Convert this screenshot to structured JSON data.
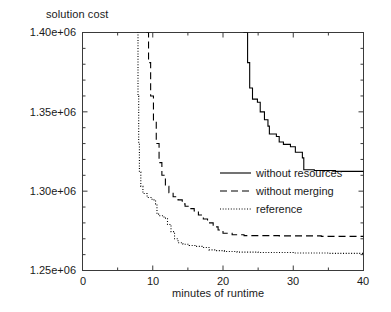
{
  "chart_data": {
    "type": "line",
    "title": "",
    "xlabel": "minutes of runtime",
    "ylabel": "solution cost",
    "xlim": [
      0,
      40
    ],
    "ylim": [
      1250000,
      1400000
    ],
    "xticks": [
      0,
      10,
      20,
      30,
      40
    ],
    "xtick_labels": [
      "0",
      "10",
      "20",
      "30",
      "40"
    ],
    "yticks": [
      1250000,
      1300000,
      1350000,
      1400000
    ],
    "ytick_labels": [
      "1.25e+06",
      "1.30e+06",
      "1.35e+06",
      "1.40e+06"
    ],
    "minor_ticks": true,
    "grid": false,
    "legend_position": "center-right",
    "series": [
      {
        "name": "without resources",
        "style": "solid",
        "color": "#000000",
        "points": [
          [
            22.9,
            1400000
          ],
          [
            23.2,
            1400000
          ],
          [
            23.5,
            1381000
          ],
          [
            23.8,
            1365000
          ],
          [
            24.2,
            1358000
          ],
          [
            24.9,
            1356000
          ],
          [
            25.3,
            1350000
          ],
          [
            25.9,
            1345000
          ],
          [
            26.4,
            1341000
          ],
          [
            26.6,
            1336000
          ],
          [
            27.6,
            1334500
          ],
          [
            28.0,
            1331000
          ],
          [
            28.6,
            1329500
          ],
          [
            29.6,
            1328000
          ],
          [
            30.3,
            1324500
          ],
          [
            31.3,
            1321000
          ],
          [
            31.5,
            1313500
          ],
          [
            33.0,
            1313000
          ],
          [
            36.0,
            1312500
          ],
          [
            40.0,
            1312000
          ]
        ]
      },
      {
        "name": "without merging",
        "style": "dashed",
        "color": "#000000",
        "points": [
          [
            9.1,
            1400000
          ],
          [
            9.4,
            1381000
          ],
          [
            9.7,
            1360000
          ],
          [
            10.1,
            1344000
          ],
          [
            10.5,
            1330000
          ],
          [
            10.9,
            1318000
          ],
          [
            11.3,
            1310000
          ],
          [
            11.8,
            1303000
          ],
          [
            12.3,
            1299000
          ],
          [
            12.9,
            1296500
          ],
          [
            13.6,
            1294500
          ],
          [
            14.2,
            1292000
          ],
          [
            14.6,
            1290500
          ],
          [
            15.3,
            1289000
          ],
          [
            15.9,
            1287500
          ],
          [
            16.5,
            1285000
          ],
          [
            17.2,
            1282500
          ],
          [
            17.8,
            1280000
          ],
          [
            18.6,
            1277500
          ],
          [
            19.3,
            1275500
          ],
          [
            20.0,
            1273500
          ],
          [
            21.3,
            1272500
          ],
          [
            23.0,
            1272000
          ],
          [
            28.0,
            1271800
          ],
          [
            34.0,
            1271500
          ],
          [
            40.0,
            1271200
          ]
        ]
      },
      {
        "name": "reference",
        "style": "dotted",
        "color": "#000000",
        "points": [
          [
            7.8,
            1400000
          ],
          [
            7.9,
            1360000
          ],
          [
            8.0,
            1330000
          ],
          [
            8.1,
            1312000
          ],
          [
            8.3,
            1303000
          ],
          [
            8.6,
            1298500
          ],
          [
            9.2,
            1296000
          ],
          [
            9.9,
            1294500
          ],
          [
            10.4,
            1292000
          ],
          [
            10.6,
            1285500
          ],
          [
            11.0,
            1284500
          ],
          [
            11.6,
            1283000
          ],
          [
            12.1,
            1279000
          ],
          [
            12.6,
            1274500
          ],
          [
            13.1,
            1270000
          ],
          [
            13.6,
            1267500
          ],
          [
            14.3,
            1266500
          ],
          [
            15.2,
            1265800
          ],
          [
            16.0,
            1265200
          ],
          [
            17.0,
            1264500
          ],
          [
            18.0,
            1263000
          ],
          [
            19.0,
            1262500
          ],
          [
            20.2,
            1262000
          ],
          [
            22.0,
            1261600
          ],
          [
            25.0,
            1261300
          ],
          [
            30.0,
            1261000
          ],
          [
            35.0,
            1260800
          ],
          [
            40.0,
            1260600
          ]
        ]
      }
    ],
    "legend": [
      {
        "label": "without resources",
        "style": "solid"
      },
      {
        "label": "without merging",
        "style": "dashed"
      },
      {
        "label": "reference",
        "style": "dotted"
      }
    ]
  }
}
